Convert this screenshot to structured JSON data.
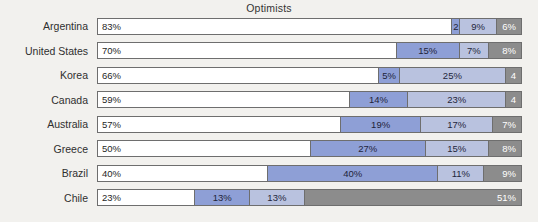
{
  "chart_data": {
    "type": "bar",
    "subtype": "stacked-horizontal-100",
    "title": "Optimists",
    "xlabel": "",
    "ylabel": "",
    "xlim": [
      0,
      100
    ],
    "grid": false,
    "legend": "none",
    "categories": [
      "Argentina",
      "United States",
      "Korea",
      "Canada",
      "Australia",
      "Greece",
      "Brazil",
      "Chile"
    ],
    "series": [
      {
        "name": "Segment 1",
        "color": "#ffffff",
        "values": [
          83,
          70,
          66,
          59,
          57,
          50,
          40,
          23
        ]
      },
      {
        "name": "Segment 2",
        "color": "#8e9fd6",
        "values": [
          2,
          15,
          5,
          14,
          19,
          27,
          40,
          13
        ]
      },
      {
        "name": "Segment 3",
        "color": "#b9c2df",
        "values": [
          9,
          7,
          25,
          23,
          17,
          15,
          11,
          13
        ]
      },
      {
        "name": "Segment 4",
        "color": "#8c8c8c",
        "values": [
          6,
          8,
          4,
          4,
          7,
          8,
          9,
          51
        ]
      }
    ],
    "rows": [
      {
        "label": "Argentina",
        "segments": [
          {
            "value": 83,
            "text": "83%",
            "color": "#ffffff"
          },
          {
            "value": 2,
            "text": "2",
            "color": "#8e9fd6"
          },
          {
            "value": 9,
            "text": "9%",
            "color": "#b9c2df"
          },
          {
            "value": 6,
            "text": "6%",
            "color": "#8c8c8c"
          }
        ]
      },
      {
        "label": "United States",
        "segments": [
          {
            "value": 70,
            "text": "70%",
            "color": "#ffffff"
          },
          {
            "value": 15,
            "text": "15%",
            "color": "#8e9fd6"
          },
          {
            "value": 7,
            "text": "7%",
            "color": "#b9c2df"
          },
          {
            "value": 8,
            "text": "8%",
            "color": "#8c8c8c"
          }
        ]
      },
      {
        "label": "Korea",
        "segments": [
          {
            "value": 66,
            "text": "66%",
            "color": "#ffffff"
          },
          {
            "value": 5,
            "text": "5%",
            "color": "#8e9fd6"
          },
          {
            "value": 25,
            "text": "25%",
            "color": "#b9c2df"
          },
          {
            "value": 4,
            "text": "4",
            "color": "#8c8c8c"
          }
        ]
      },
      {
        "label": "Canada",
        "segments": [
          {
            "value": 59,
            "text": "59%",
            "color": "#ffffff"
          },
          {
            "value": 14,
            "text": "14%",
            "color": "#8e9fd6"
          },
          {
            "value": 23,
            "text": "23%",
            "color": "#b9c2df"
          },
          {
            "value": 4,
            "text": "4",
            "color": "#8c8c8c"
          }
        ]
      },
      {
        "label": "Australia",
        "segments": [
          {
            "value": 57,
            "text": "57%",
            "color": "#ffffff"
          },
          {
            "value": 19,
            "text": "19%",
            "color": "#8e9fd6"
          },
          {
            "value": 17,
            "text": "17%",
            "color": "#b9c2df"
          },
          {
            "value": 7,
            "text": "7%",
            "color": "#8c8c8c"
          }
        ]
      },
      {
        "label": "Greece",
        "segments": [
          {
            "value": 50,
            "text": "50%",
            "color": "#ffffff"
          },
          {
            "value": 27,
            "text": "27%",
            "color": "#8e9fd6"
          },
          {
            "value": 15,
            "text": "15%",
            "color": "#b9c2df"
          },
          {
            "value": 8,
            "text": "8%",
            "color": "#8c8c8c"
          }
        ]
      },
      {
        "label": "Brazil",
        "segments": [
          {
            "value": 40,
            "text": "40%",
            "color": "#ffffff"
          },
          {
            "value": 40,
            "text": "40%",
            "color": "#8e9fd6"
          },
          {
            "value": 11,
            "text": "11%",
            "color": "#b9c2df"
          },
          {
            "value": 9,
            "text": "9%",
            "color": "#8c8c8c"
          }
        ]
      },
      {
        "label": "Chile",
        "segments": [
          {
            "value": 23,
            "text": "23%",
            "color": "#ffffff"
          },
          {
            "value": 13,
            "text": "13%",
            "color": "#8e9fd6"
          },
          {
            "value": 13,
            "text": "13%",
            "color": "#b9c2df"
          },
          {
            "value": 51,
            "text": "51%",
            "color": "#8c8c8c"
          }
        ]
      }
    ]
  }
}
